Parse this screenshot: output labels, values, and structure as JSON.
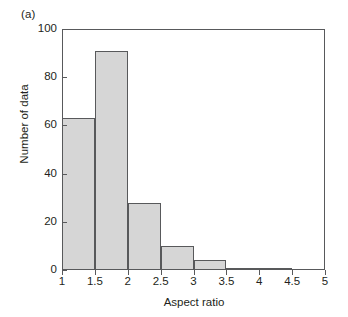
{
  "panel": {
    "label": "(a)"
  },
  "colors": {
    "bar_fill": "#d6d6d6",
    "bar_edge": "#58595b",
    "axis": "#58595b",
    "text": "#231f20",
    "background": "#ffffff"
  },
  "axes": {
    "x_title": "Aspect ratio",
    "y_title": "Number of data",
    "x_ticks": [
      "1",
      "1.5",
      "2",
      "2.5",
      "3",
      "3.5",
      "4",
      "4.5",
      "5"
    ],
    "y_ticks": [
      "0",
      "20",
      "40",
      "60",
      "80",
      "100"
    ]
  },
  "chart_data": {
    "type": "bar",
    "title": "(a)",
    "subtitle": "",
    "xlabel": "Aspect ratio",
    "ylabel": "Number of data",
    "xlim": [
      1,
      5
    ],
    "ylim": [
      0,
      100
    ],
    "x_tick_values": [
      1,
      1.5,
      2,
      2.5,
      3,
      3.5,
      4,
      4.5,
      5
    ],
    "y_tick_values": [
      0,
      20,
      40,
      60,
      80,
      100
    ],
    "grid": false,
    "legend": "none",
    "bin_width": 0.5,
    "bin_edges": [
      1,
      1.5,
      2,
      2.5,
      3,
      3.5,
      4,
      4.5,
      5
    ],
    "categories": [
      "1-1.5",
      "1.5-2",
      "2-2.5",
      "2.5-3",
      "3-3.5",
      "3.5-4",
      "4-4.5",
      "4.5-5"
    ],
    "values": [
      63,
      91,
      28,
      10,
      4,
      1,
      1,
      0
    ],
    "bars": [
      {
        "bin_start": 1,
        "bin_end": 1.5,
        "value": 63
      },
      {
        "bin_start": 1.5,
        "bin_end": 2,
        "value": 91
      },
      {
        "bin_start": 2,
        "bin_end": 2.5,
        "value": 28
      },
      {
        "bin_start": 2.5,
        "bin_end": 3,
        "value": 10
      },
      {
        "bin_start": 3,
        "bin_end": 3.5,
        "value": 4
      },
      {
        "bin_start": 3.5,
        "bin_end": 4,
        "value": 1
      },
      {
        "bin_start": 4,
        "bin_end": 4.5,
        "value": 1
      },
      {
        "bin_start": 4.5,
        "bin_end": 5,
        "value": 0
      }
    ]
  }
}
